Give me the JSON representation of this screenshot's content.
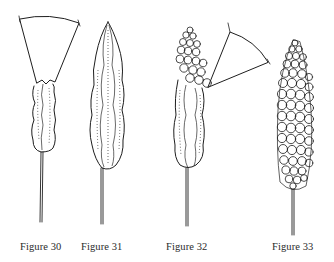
{
  "plate": {
    "figures": [
      {
        "id": "fig30",
        "caption": "Figure 30",
        "description": "Elongated ribbed capsule with conical stippled hood on top, on long seta"
      },
      {
        "id": "fig31",
        "caption": "Figure 31",
        "description": "Pointed lanceolate ribbed capsule on long seta"
      },
      {
        "id": "fig32",
        "caption": "Figure 32",
        "description": "Ribbed capsule with beaded cluster at apex and detached stippled hood, on long seta"
      },
      {
        "id": "fig33",
        "caption": "Figure 33",
        "description": "Capsule fully covered with rounded beads, on long seta"
      }
    ]
  },
  "colors": {
    "ink": "#1e1e1e",
    "background": "#ffffff"
  }
}
